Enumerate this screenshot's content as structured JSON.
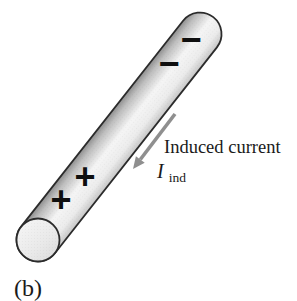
{
  "figure": {
    "caption": "(b)",
    "current_annotation": {
      "label": "Induced current",
      "symbol": "I",
      "subscript": "ind"
    },
    "charges": {
      "negative": [
        "−",
        "−"
      ],
      "positive": [
        "+",
        "+"
      ]
    },
    "colors": {
      "background": "#ffffff",
      "rod_outline": "#2b2b2b",
      "rod_shade_dark": "#8e8e8e",
      "rod_highlight": "#f5f5f5",
      "rod_shade_light": "#c6c6c6",
      "end_face": "#e9e9e9",
      "arrow": "#8f8f8f",
      "charge": "#0f0f0f",
      "text": "#1a1a1a"
    }
  }
}
